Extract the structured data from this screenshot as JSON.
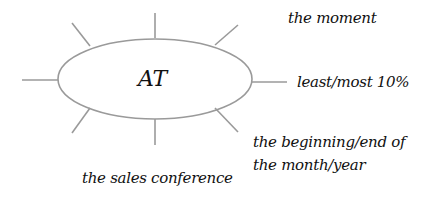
{
  "diagram": {
    "center": {
      "label": "AT"
    },
    "colors": {
      "stroke": "#9a9a9a",
      "text": "#111111",
      "background": "#ffffff"
    },
    "rays": [
      {
        "name": "top"
      },
      {
        "name": "top-left"
      },
      {
        "name": "left"
      },
      {
        "name": "bottom-left"
      },
      {
        "name": "bottom"
      },
      {
        "name": "bottom-right"
      },
      {
        "name": "right"
      },
      {
        "name": "top-right"
      }
    ],
    "labels": [
      {
        "text": "the moment"
      },
      {
        "text": "least/most 10%"
      },
      {
        "text": "the beginning/end of the month/year"
      },
      {
        "text": "the sales conference"
      }
    ]
  }
}
